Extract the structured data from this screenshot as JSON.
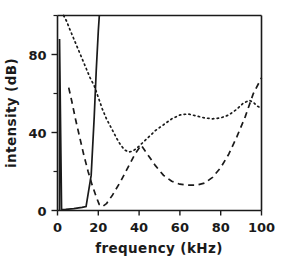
{
  "chart_data": {
    "type": "line",
    "title": "",
    "xlabel": "frequency (kHz)",
    "ylabel": "intensity (dB)",
    "xlim": [
      0,
      100
    ],
    "ylim": [
      0,
      100
    ],
    "xticks": [
      0,
      20,
      40,
      60,
      80,
      100
    ],
    "xtick_labels": [
      "0",
      "20",
      "40",
      "60",
      "80",
      "100"
    ],
    "yticks": [
      0,
      40,
      80
    ],
    "ytick_labels": [
      "0",
      "40",
      "80"
    ],
    "yticks_minor": [
      20,
      60,
      100
    ],
    "grid": false,
    "legend": "none",
    "series": [
      {
        "name": "solid-curve",
        "style": "solid",
        "x": [
          1.0,
          1.0,
          2.0,
          4.0,
          8.0,
          12.0,
          14.0,
          16.5,
          18.0,
          19.0,
          20.0,
          20.5
        ],
        "y": [
          0.0,
          88.0,
          0.5,
          0.6,
          1.0,
          1.6,
          2.0,
          18.0,
          48.0,
          72.0,
          92.0,
          100.0
        ]
      },
      {
        "name": "dashed-curve",
        "style": "dashed",
        "x": [
          5.5,
          7.0,
          9.0,
          11.0,
          13.0,
          15.0,
          17.0,
          19.0,
          20.5,
          22.0,
          24.0,
          27.0,
          31.0,
          35.0,
          38.0,
          41.0,
          44.0,
          48.0,
          52.0,
          56.0,
          60.0,
          64.0,
          68.0,
          72.0,
          76.0,
          80.0,
          84.0,
          88.0,
          92.0,
          96.0,
          100.0
        ],
        "y": [
          63.0,
          56.0,
          46.0,
          37.0,
          28.0,
          20.0,
          13.0,
          7.0,
          3.0,
          2.0,
          3.5,
          8.0,
          15.0,
          23.0,
          29.0,
          33.5,
          29.0,
          23.0,
          18.0,
          15.0,
          13.5,
          13.0,
          13.0,
          14.0,
          17.0,
          22.0,
          29.0,
          38.0,
          48.0,
          60.0,
          68.0
        ]
      },
      {
        "name": "dotted-curve",
        "style": "dotted",
        "x": [
          3.0,
          4.5,
          6.0,
          8.0,
          10.0,
          12.0,
          14.0,
          16.0,
          18.0,
          20.0,
          22.0,
          24.0,
          26.5,
          29.0,
          31.0,
          33.0,
          35.0,
          37.0,
          40.0,
          44.0,
          48.0,
          52.0,
          56.0,
          60.0,
          64.0,
          68.0,
          72.0,
          76.0,
          80.0,
          84.0,
          88.0,
          91.0,
          94.0,
          96.0,
          98.0,
          100.0
        ],
        "y": [
          100.0,
          97.0,
          93.0,
          88.0,
          83.0,
          78.0,
          73.0,
          68.0,
          64.0,
          58.0,
          52.0,
          47.0,
          42.0,
          37.0,
          33.5,
          31.0,
          30.0,
          30.5,
          33.0,
          37.0,
          41.0,
          44.0,
          47.0,
          49.0,
          49.5,
          48.5,
          47.5,
          47.0,
          47.5,
          49.0,
          52.0,
          55.0,
          56.5,
          55.5,
          53.5,
          52.5
        ]
      }
    ]
  }
}
